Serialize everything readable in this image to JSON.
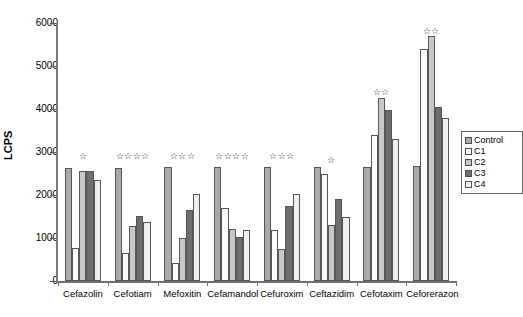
{
  "chart_data": {
    "type": "bar",
    "title": "",
    "xlabel": "",
    "ylabel": "LCPS",
    "ylim": [
      0,
      6000
    ],
    "ytick_labels": [
      "6000",
      "5000",
      "4000",
      "3000",
      "2000",
      "1000",
      "0"
    ],
    "yticks": [
      6000,
      5000,
      4000,
      3000,
      2000,
      1000,
      0
    ],
    "grid": false,
    "legend_position": "right",
    "categories": [
      "Cefazolin",
      "Cefotiam",
      "Mefoxitin",
      "Cefamandol",
      "Cefuroxim",
      "Ceftazidim",
      "Cefotaxim",
      "Ceforerazon"
    ],
    "series": [
      {
        "name": "Control",
        "key": "control",
        "color": "#a9a9a9",
        "values": [
          2620,
          2630,
          2640,
          2650,
          2650,
          2650,
          2660,
          2670
        ]
      },
      {
        "name": "C1",
        "key": "c1",
        "color": "#fcfcfc",
        "values": [
          760,
          650,
          410,
          1700,
          1190,
          2500,
          3390,
          5400
        ]
      },
      {
        "name": "C2",
        "key": "c2",
        "color": "#c8c8c8",
        "values": [
          2560,
          1270,
          990,
          1220,
          740,
          1300,
          4250,
          5700
        ]
      },
      {
        "name": "C3",
        "key": "c3",
        "color": "#6e6e6e",
        "values": [
          2570,
          1520,
          1640,
          1030,
          1750,
          1910,
          3970,
          4050
        ]
      },
      {
        "name": "C4",
        "key": "c4",
        "color": "#efefef",
        "values": [
          2350,
          1380,
          2030,
          1190,
          2020,
          1500,
          3300,
          3800
        ]
      }
    ],
    "significance_markers": [
      "☆",
      "☆☆☆☆",
      "☆☆☆",
      "☆☆☆☆",
      "☆☆☆",
      "☆",
      "☆☆",
      "☆☆"
    ],
    "significance_y": [
      3000,
      3000,
      3000,
      3000,
      3000,
      2900,
      4500,
      5900
    ]
  },
  "legend": {
    "items": [
      {
        "label": "Control",
        "key": "control"
      },
      {
        "label": "C1",
        "key": "c1"
      },
      {
        "label": "C2",
        "key": "c2"
      },
      {
        "label": "C3",
        "key": "c3"
      },
      {
        "label": "C4",
        "key": "c4"
      }
    ]
  }
}
